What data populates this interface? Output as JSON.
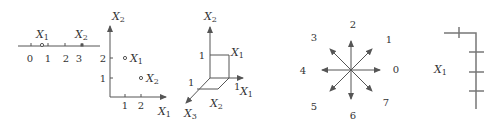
{
  "colors": {
    "stroke": "#555555",
    "text": "#333333",
    "background": "#ffffff"
  },
  "panel1_number_line": {
    "tick_labels": [
      "0",
      "1",
      "2",
      "3"
    ],
    "points": [
      {
        "label": "X",
        "sub": "1",
        "marker": "open-circle"
      },
      {
        "label": "X",
        "sub": "2",
        "marker": "filled-square"
      }
    ]
  },
  "panel2_plane": {
    "axis_x_label": "X",
    "axis_x_sub": "1",
    "axis_y_label": "X",
    "axis_y_sub": "2",
    "x_ticks": [
      "1",
      "2"
    ],
    "y_ticks": [
      "1",
      "2"
    ],
    "points": [
      {
        "label": "X",
        "sub": "1",
        "x": 1,
        "y": 2
      },
      {
        "label": "X",
        "sub": "2",
        "x": 2,
        "y": 1
      }
    ]
  },
  "panel3_3d": {
    "axis_up_label": "X",
    "axis_up_sub": "2",
    "axis_right_label": "X",
    "axis_right_sub": "1",
    "axis_out_label": "X",
    "axis_out_sub": "3",
    "tick_up": "1",
    "tick_right": "1",
    "tick_out": "1",
    "point_label": "X",
    "point_sub": "1",
    "floor_label": "X",
    "floor_sub": "2"
  },
  "panel4_directions": {
    "labels": [
      "0",
      "1",
      "2",
      "3",
      "4",
      "5",
      "6",
      "7"
    ]
  },
  "panel5_chain": {
    "label": "X",
    "sub": "1"
  }
}
